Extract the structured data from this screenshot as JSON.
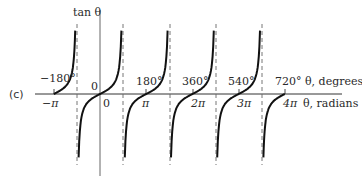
{
  "panel_label": "(c)",
  "chart_data": {
    "type": "line",
    "title": "",
    "function": "tan θ",
    "ylabel": "tan θ",
    "xlabel_degrees": "θ, degrees",
    "xlabel_radians": "θ, radians",
    "degree_ticks": [
      "−180°",
      "0",
      "180°",
      "360°",
      "540°",
      "720°"
    ],
    "degree_tick_values": [
      -180,
      0,
      180,
      360,
      540,
      720
    ],
    "radian_ticks": [
      "−π",
      "0",
      "π",
      "2π",
      "3π",
      "4π"
    ],
    "radian_tick_values": [
      -3.1416,
      0,
      3.1416,
      6.2832,
      9.4248,
      12.5664
    ],
    "asymptotes_degrees": [
      -90,
      90,
      270,
      450,
      630
    ],
    "xlim_degrees": [
      -240,
      810
    ],
    "ylim": [
      -6,
      6
    ],
    "grid": false,
    "legend": null,
    "series": [
      {
        "name": "tan θ branch 1",
        "x_degrees_range": [
          -180,
          -90
        ]
      },
      {
        "name": "tan θ branch 2",
        "x_degrees_range": [
          -90,
          90
        ]
      },
      {
        "name": "tan θ branch 3",
        "x_degrees_range": [
          90,
          270
        ]
      },
      {
        "name": "tan θ branch 4",
        "x_degrees_range": [
          270,
          450
        ]
      },
      {
        "name": "tan θ branch 5",
        "x_degrees_range": [
          450,
          630
        ]
      },
      {
        "name": "tan θ branch 6",
        "x_degrees_range": [
          630,
          720
        ]
      }
    ]
  },
  "labels": {
    "ylabel": "tan θ",
    "deg_m180": "−180°",
    "deg_0": "0",
    "deg_180": "180°",
    "deg_360": "360°",
    "deg_540": "540°",
    "deg_720": "720°",
    "deg_axis": "θ, degrees",
    "rad_mpi": "−π",
    "rad_0": "0",
    "rad_pi": "π",
    "rad_2pi": "2π",
    "rad_3pi": "3π",
    "rad_4pi": "4π",
    "rad_axis": "θ, radians"
  }
}
